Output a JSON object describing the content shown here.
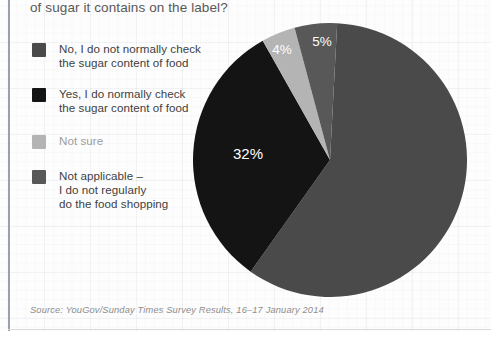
{
  "title": "of sugar it contains on the label?",
  "source": "Source: YouGov/Sunday Times Survey Results, 16–17 January 2014",
  "legend": [
    {
      "label_line1": "No, I do not normally check",
      "label_line2": "the sugar content of food",
      "color": "#4a4a4a",
      "muted": false
    },
    {
      "label_line1": "Yes, I do normally check",
      "label_line2": "the sugar content of food",
      "color": "#141414",
      "muted": false
    },
    {
      "label_line1": "Not sure",
      "label_line2": "",
      "color": "#b4b4b4",
      "muted": true
    },
    {
      "label_line1": "Not applicable –",
      "label_line2": "I do not regularly",
      "label_line3": "do the food shopping",
      "color": "#585858",
      "muted": false
    }
  ],
  "chart_data": {
    "type": "pie",
    "title": "of sugar it contains on the label?",
    "source": "Source: YouGov/Sunday Times Survey Results, 16–17 January 2014",
    "legend_position": "left",
    "grid": false,
    "categories": [
      "No, I do not normally check the sugar content of food",
      "Yes, I do normally check the sugar content of food",
      "Not sure",
      "Not applicable – I do not regularly do the food shopping"
    ],
    "values": [
      59,
      32,
      4,
      5
    ],
    "value_labels": [
      "59%",
      "32%",
      "4%",
      "5%"
    ],
    "colors": [
      "#4a4a4a",
      "#141414",
      "#b4b4b4",
      "#585858"
    ],
    "units": "percent",
    "start_angle_deg": 3,
    "direction": "clockwise",
    "slices": [
      {
        "name": "No, I do not normally check the sugar content of food",
        "value": 59,
        "label": "59%",
        "color": "#4a4a4a",
        "label_x": 78,
        "label_y": 155
      },
      {
        "name": "Yes, I do normally check the sugar content of food",
        "value": 32,
        "label": "32%",
        "color": "#141414",
        "label_x": -82,
        "label_y": -5
      },
      {
        "name": "Not sure",
        "value": 4,
        "label": "4%",
        "color": "#b4b4b4",
        "label_x": -48,
        "label_y": -110
      },
      {
        "name": "Not applicable – I do not regularly do the food shopping",
        "value": 5,
        "label": "5%",
        "color": "#585858",
        "label_x": -8,
        "label_y": -118
      }
    ]
  }
}
